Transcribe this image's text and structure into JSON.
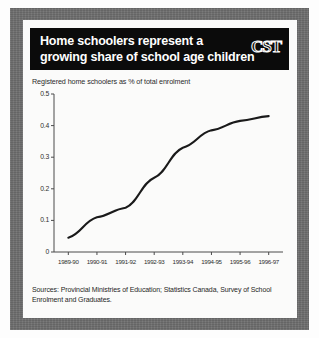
{
  "card": {
    "title_line1": "Home schoolers represent a",
    "title_line2": "growing share of school age children",
    "logo": "CST",
    "subtitle": "Registered home schoolers as % of total enrolment",
    "source": "Sources: Provincial Ministries of Education; Statistics Canada, Survey of School Enrolment and Graduates."
  },
  "colors": {
    "banner": "#0b0b0b",
    "frame": "#6e6e6e",
    "card": "#fbfbfa",
    "line": "#1a1a1a",
    "axis": "#4a4a4a",
    "text": "#1f1f1f"
  },
  "chart_data": {
    "type": "line",
    "title": "Home schoolers represent a growing share of school age children",
    "subtitle": "Registered home schoolers as % of total enrolment",
    "xlabel": "",
    "ylabel": "",
    "categories": [
      "1989-90",
      "1990-91",
      "1991-92",
      "1992-93",
      "1993-94",
      "1994-95",
      "1995-96",
      "1996-97"
    ],
    "values": [
      0.045,
      0.11,
      0.14,
      0.235,
      0.33,
      0.385,
      0.415,
      0.43
    ],
    "ylim": [
      0,
      0.5
    ],
    "yticks": [
      0,
      0.1,
      0.2,
      0.3,
      0.4,
      0.5
    ],
    "ytick_labels": [
      "0",
      "0.1",
      "0.2",
      "0.3",
      "0.4",
      "0.5"
    ],
    "grid": false,
    "legend": "none",
    "markers": false,
    "series": [
      {
        "name": "Registered home schoolers as % of total enrolment",
        "values": [
          0.045,
          0.11,
          0.14,
          0.235,
          0.33,
          0.385,
          0.415,
          0.43
        ]
      }
    ]
  }
}
